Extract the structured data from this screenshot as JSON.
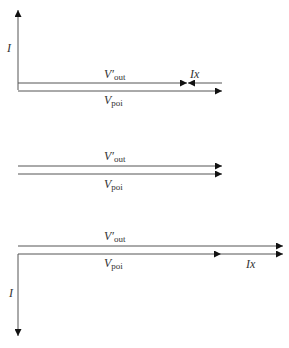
{
  "diagram": {
    "colors": {
      "line": "#555555",
      "arrow": "#111111",
      "text": "#333333"
    },
    "panel_top": {
      "axis_label": "I",
      "upper_label": {
        "main": "V′",
        "sub": "out"
      },
      "lower_label": {
        "main": "V",
        "sub": "poi"
      },
      "ix_label": "Ix"
    },
    "panel_middle": {
      "upper_label": {
        "main": "V′",
        "sub": "out"
      },
      "lower_label": {
        "main": "V",
        "sub": "poi"
      }
    },
    "panel_bottom": {
      "axis_label": "I",
      "upper_label": {
        "main": "V′",
        "sub": "out"
      },
      "lower_label": {
        "main": "V",
        "sub": "poi"
      },
      "ix_label": "Ix"
    }
  }
}
